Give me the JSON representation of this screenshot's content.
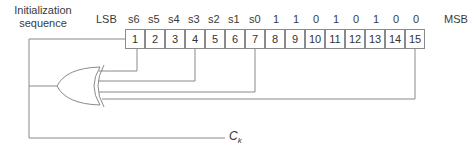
{
  "title": {
    "line1": "Initialization",
    "line2": "sequence"
  },
  "lsb_label": "LSB",
  "msb_label": "MSB",
  "register": {
    "top_labels": [
      "s6",
      "s5",
      "s4",
      "s3",
      "s2",
      "s1",
      "s0",
      "1",
      "1",
      "0",
      "1",
      "0",
      "1",
      "0",
      "0"
    ],
    "cells": [
      "1",
      "2",
      "3",
      "4",
      "5",
      "6",
      "7",
      "8",
      "9",
      "10",
      "11",
      "12",
      "13",
      "14",
      "15"
    ],
    "taps": [
      "1",
      "4",
      "7",
      "15"
    ]
  },
  "gate": {
    "type": "XOR",
    "inputs": 4
  },
  "output": {
    "symbol": "C",
    "subscript": "k"
  },
  "colors": {
    "line": "#8a8a8a",
    "text": "#333333"
  }
}
